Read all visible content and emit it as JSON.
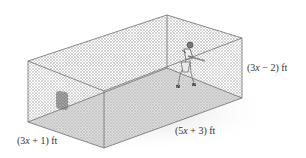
{
  "figure": {
    "dimensions": {
      "length": {
        "expr_pre": "(5",
        "var": "x",
        "expr_post": " + 3) ft"
      },
      "width": {
        "expr_pre": "(3",
        "var": "x",
        "expr_post": " + 1) ft"
      },
      "height": {
        "expr_pre": "(3",
        "var": "x",
        "expr_post": " − 2) ft"
      }
    }
  },
  "colors": {
    "edge": "#6e6e6e",
    "mesh": "#b8b8b8",
    "floor": "#d9d9d9",
    "target": "#8a8a8a",
    "text": "#333333"
  }
}
